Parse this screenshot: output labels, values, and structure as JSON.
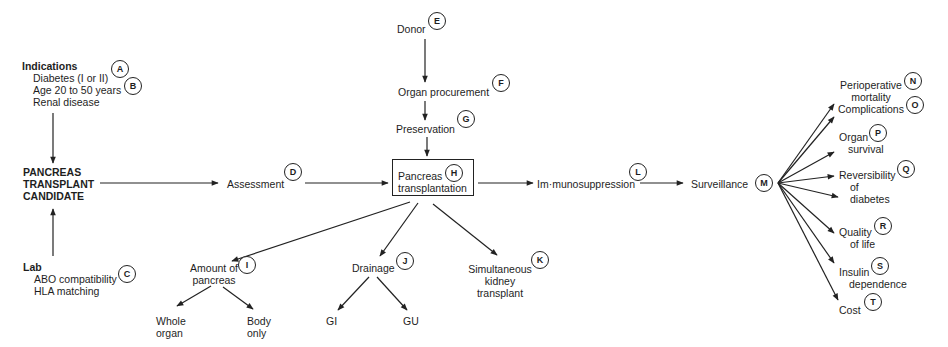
{
  "diagram": {
    "indications": {
      "heading": "Indications",
      "items": [
        "Diabetes (I or II)",
        "Age 20 to 50 years",
        "Renal disease"
      ],
      "badges": [
        "A",
        "B"
      ]
    },
    "candidate": {
      "lines": [
        "PANCREAS",
        "TRANSPLANT",
        "CANDIDATE"
      ]
    },
    "lab": {
      "heading": "Lab",
      "items": [
        "ABO compatibility",
        "HLA matching"
      ],
      "badge": "C"
    },
    "assessment": {
      "label": "Assessment",
      "badge": "D"
    },
    "donor": {
      "label": "Donor",
      "badge": "E"
    },
    "organ_procurement": {
      "label": "Organ procurement",
      "badge": "F"
    },
    "preservation": {
      "label": "Preservation",
      "badge": "G"
    },
    "transplantation": {
      "lines": [
        "Pancreas",
        "transplantation"
      ],
      "badge": "H"
    },
    "amount": {
      "lines": [
        "Amount of",
        "pancreas"
      ],
      "badge": "I",
      "children": [
        {
          "lines": [
            "Whole",
            "organ"
          ]
        },
        {
          "lines": [
            "Body",
            "only"
          ]
        }
      ]
    },
    "drainage": {
      "label": "Drainage",
      "badge": "J",
      "children": [
        {
          "label": "GI"
        },
        {
          "label": "GU"
        }
      ]
    },
    "simultaneous": {
      "lines": [
        "Simultaneous",
        "kidney",
        "transplant"
      ],
      "badge": "K"
    },
    "immunosuppression": {
      "label": "Im·munosuppression",
      "badge": "L"
    },
    "surveillance": {
      "label": "Surveillance",
      "badge": "M"
    },
    "outcomes": [
      {
        "lines": [
          "Perioperative",
          "mortality"
        ],
        "badge": "N"
      },
      {
        "lines": [
          "Complications"
        ],
        "badge": "O"
      },
      {
        "lines": [
          "Organ",
          "survival"
        ],
        "badge": "P"
      },
      {
        "lines": [
          "Reversibility",
          "of",
          "diabetes"
        ],
        "badge": "Q"
      },
      {
        "lines": [
          "Quality",
          "of life"
        ],
        "badge": "R"
      },
      {
        "lines": [
          "Insulin",
          "dependence"
        ],
        "badge": "S"
      },
      {
        "lines": [
          "Cost"
        ],
        "badge": "T"
      }
    ]
  },
  "colors": {
    "line": "#222222",
    "text": "#1e1e1e",
    "background": "#ffffff"
  }
}
